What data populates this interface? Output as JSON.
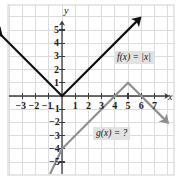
{
  "figure": {
    "background_color": "#ffffff",
    "grid_color": "#d8d8d8",
    "axis_color": "#3a3a3a",
    "border_color": "#cccccc"
  },
  "axes": {
    "x_name": "x",
    "y_name": "y",
    "x_ticks": [
      {
        "value": -3,
        "label": "−3"
      },
      {
        "value": -2,
        "label": "−2"
      },
      {
        "value": -1,
        "label": "−1"
      },
      {
        "value": 1,
        "label": "1"
      },
      {
        "value": 2,
        "label": "2"
      },
      {
        "value": 3,
        "label": "3"
      },
      {
        "value": 4,
        "label": "4"
      },
      {
        "value": 5,
        "label": "5"
      },
      {
        "value": 6,
        "label": "6"
      },
      {
        "value": 7,
        "label": "7"
      }
    ],
    "y_ticks": [
      {
        "value": 5,
        "label": "5"
      },
      {
        "value": 4,
        "label": "4"
      },
      {
        "value": 3,
        "label": "3"
      },
      {
        "value": 2,
        "label": "2"
      },
      {
        "value": 1,
        "label": "1"
      },
      {
        "value": -1,
        "label": "−1"
      },
      {
        "value": -2,
        "label": "−2"
      },
      {
        "value": -3,
        "label": "−3"
      },
      {
        "value": -4,
        "label": "−4"
      },
      {
        "value": -5,
        "label": "−5"
      }
    ]
  },
  "chart_data": {
    "type": "line",
    "title": "",
    "xlabel": "x",
    "ylabel": "y",
    "xlim": [
      -4.8,
      8.5
    ],
    "ylim": [
      -6.0,
      6.2
    ],
    "grid": true,
    "legend": "inline-labels",
    "series": [
      {
        "name": "f",
        "label": "f(x) = |x|",
        "color": "#111111",
        "width": 2.2,
        "arrow_start": true,
        "arrow_end": true,
        "points": [
          {
            "x": -4.6,
            "y": 4.6
          },
          {
            "x": 0,
            "y": 0
          },
          {
            "x": 5.9,
            "y": 5.9
          }
        ]
      },
      {
        "name": "g",
        "label": "g(x) = ?",
        "color": "#8e8e8e",
        "width": 2.2,
        "arrow_start": false,
        "arrow_end": true,
        "points": [
          {
            "x": -0.9,
            "y": -5.9
          },
          {
            "x": 0,
            "y": -4.0
          },
          {
            "x": 5,
            "y": 1
          },
          {
            "x": 8.0,
            "y": -2.0
          }
        ]
      }
    ],
    "annotations": [
      {
        "text": "f(x) = |x|",
        "x": 6.2,
        "y": 2.6
      },
      {
        "text": "g(x) = ?",
        "x": 2.9,
        "y": -3.1
      }
    ]
  },
  "labels": {
    "f_label": "f(x) = |x|",
    "g_label": "g(x) = ?"
  }
}
